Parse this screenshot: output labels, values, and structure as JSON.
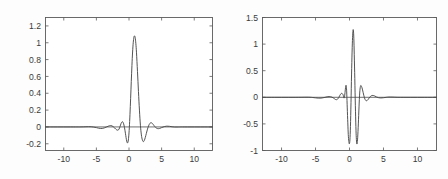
{
  "figure": {
    "background_color": "#fdfdfd",
    "axes_color": "#5a5a5a",
    "curve_color": "#4a4a4a"
  },
  "chart_data": [
    {
      "type": "line",
      "title": "",
      "xlabel": "",
      "ylabel": "",
      "panel": "left",
      "grid": false,
      "legend": "none",
      "xlim": [
        -12.8,
        12.8
      ],
      "ylim": [
        -0.28,
        1.3
      ],
      "xticks": [
        -10,
        -5,
        0,
        5,
        10
      ],
      "xticklabels": [
        "-10",
        "-5",
        "0",
        "5",
        "10"
      ],
      "yticks": [
        -0.2,
        0,
        0.2,
        0.4,
        0.6,
        0.8,
        1,
        1.2
      ],
      "yticklabels": [
        "-0.2",
        "0",
        "0.2",
        "0.4",
        "0.6",
        "0.8",
        "1",
        "1.2"
      ],
      "series": [
        {
          "name": "scaling function",
          "x": [
            -12.8,
            -12.0,
            -11.0,
            -10.0,
            -9.0,
            -8.0,
            -7.5,
            -7.0,
            -6.6,
            -6.2,
            -5.8,
            -5.4,
            -5.0,
            -4.7,
            -4.4,
            -4.1,
            -3.8,
            -3.5,
            -3.2,
            -3.0,
            -2.8,
            -2.6,
            -2.4,
            -2.2,
            -2.0,
            -1.8,
            -1.6,
            -1.45,
            -1.3,
            -1.15,
            -1.0,
            -0.85,
            -0.7,
            -0.55,
            -0.45,
            -0.35,
            -0.25,
            -0.15,
            -0.05,
            0.05,
            0.15,
            0.25,
            0.35,
            0.45,
            0.55,
            0.65,
            0.75,
            0.85,
            0.95,
            1.05,
            1.15,
            1.3,
            1.45,
            1.6,
            1.75,
            1.9,
            2.05,
            2.2,
            2.35,
            2.5,
            2.65,
            2.8,
            3.0,
            3.2,
            3.4,
            3.6,
            3.8,
            4.1,
            4.4,
            4.7,
            5.0,
            5.4,
            5.8,
            6.2,
            6.6,
            7.0,
            7.5,
            8.0,
            9.0,
            10.0,
            11.0,
            12.0,
            12.8
          ],
          "y": [
            0.0,
            0.0,
            0.0,
            0.0,
            0.0,
            0.0,
            0.0,
            0.001,
            0.002,
            0.003,
            0.002,
            -0.002,
            -0.008,
            -0.014,
            -0.018,
            -0.018,
            -0.012,
            -0.002,
            0.008,
            0.014,
            0.016,
            0.012,
            0.002,
            -0.012,
            -0.028,
            -0.038,
            -0.034,
            -0.012,
            0.022,
            0.052,
            0.062,
            0.044,
            -0.004,
            -0.075,
            -0.125,
            -0.168,
            -0.19,
            -0.178,
            -0.12,
            -0.01,
            0.15,
            0.34,
            0.54,
            0.73,
            0.89,
            1.0,
            1.065,
            1.082,
            1.06,
            0.99,
            0.88,
            0.66,
            0.42,
            0.2,
            0.02,
            -0.095,
            -0.155,
            -0.175,
            -0.16,
            -0.125,
            -0.08,
            -0.035,
            0.012,
            0.042,
            0.05,
            0.04,
            0.02,
            -0.008,
            -0.02,
            -0.018,
            -0.008,
            0.004,
            0.009,
            0.007,
            0.002,
            -0.001,
            -0.001,
            0.0,
            0.0,
            0.0,
            0.0,
            0.0,
            0.0
          ]
        }
      ]
    },
    {
      "type": "line",
      "title": "",
      "xlabel": "",
      "ylabel": "",
      "panel": "right",
      "grid": false,
      "legend": "none",
      "xlim": [
        -12.8,
        12.8
      ],
      "ylim": [
        -1.0,
        1.5
      ],
      "xticks": [
        -10,
        -5,
        0,
        5,
        10
      ],
      "xticklabels": [
        "-10",
        "-5",
        "0",
        "5",
        "10"
      ],
      "yticks": [
        -1,
        -0.5,
        0,
        0.5,
        1,
        1.5
      ],
      "yticklabels": [
        "-1",
        "-0.5",
        "0",
        "0.5",
        "1",
        "1.5"
      ],
      "series": [
        {
          "name": "wavelet function",
          "x": [
            -12.8,
            -12.0,
            -11.0,
            -10.0,
            -9.0,
            -8.0,
            -7.0,
            -6.4,
            -5.8,
            -5.4,
            -5.0,
            -4.6,
            -4.2,
            -3.9,
            -3.6,
            -3.3,
            -3.0,
            -2.8,
            -2.6,
            -2.4,
            -2.2,
            -2.05,
            -1.9,
            -1.75,
            -1.6,
            -1.45,
            -1.3,
            -1.15,
            -1.0,
            -0.9,
            -0.8,
            -0.7,
            -0.62,
            -0.55,
            -0.5,
            -0.45,
            -0.4,
            -0.33,
            -0.25,
            -0.18,
            -0.1,
            -0.02,
            0.06,
            0.14,
            0.22,
            0.3,
            0.38,
            0.45,
            0.52,
            0.58,
            0.64,
            0.7,
            0.78,
            0.86,
            0.94,
            1.0,
            1.06,
            1.12,
            1.2,
            1.3,
            1.4,
            1.5,
            1.6,
            1.7,
            1.85,
            2.0,
            2.2,
            2.4,
            2.6,
            2.8,
            3.0,
            3.2,
            3.45,
            3.7,
            4.0,
            4.3,
            4.6,
            5.0,
            5.4,
            5.8,
            6.4,
            7.0,
            8.0,
            9.0,
            10.0,
            11.0,
            12.0,
            12.8
          ],
          "y": [
            0.0,
            0.0,
            0.0,
            0.0,
            0.0,
            0.0,
            0.001,
            0.002,
            0.001,
            -0.004,
            -0.01,
            -0.015,
            -0.015,
            -0.009,
            0.0,
            0.009,
            0.014,
            0.012,
            0.004,
            -0.01,
            -0.028,
            -0.042,
            -0.045,
            -0.034,
            -0.008,
            0.028,
            0.06,
            0.075,
            0.06,
            0.03,
            -0.015,
            0.04,
            0.14,
            0.21,
            0.225,
            0.18,
            0.06,
            -0.2,
            -0.48,
            -0.7,
            -0.83,
            -0.875,
            -0.8,
            -0.55,
            -0.1,
            0.42,
            0.85,
            1.12,
            1.26,
            1.25,
            1.1,
            0.8,
            0.35,
            -0.15,
            -0.55,
            -0.76,
            -0.86,
            -0.87,
            -0.76,
            -0.5,
            -0.18,
            0.08,
            0.2,
            0.22,
            0.175,
            0.095,
            -0.01,
            -0.06,
            -0.06,
            -0.03,
            0.005,
            0.028,
            0.035,
            0.025,
            0.005,
            -0.008,
            -0.012,
            -0.008,
            0.0,
            0.005,
            0.004,
            0.001,
            0.0,
            0.0,
            0.0,
            0.0,
            0.0,
            0.0
          ]
        }
      ]
    }
  ]
}
